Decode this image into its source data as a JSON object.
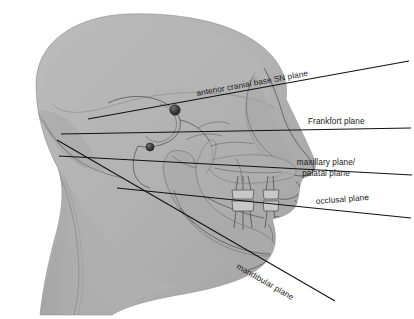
{
  "figure": {
    "background_color": "#ffffff",
    "head_fill_color": "#b0b0b0",
    "skull_fill_color": "#a2a2a2",
    "line_color": "#111111",
    "text_color": "#1a1a1a",
    "width": 414,
    "height": 319
  },
  "planes": [
    {
      "id": "sn-plane",
      "label": "anterior cranial base SN plane",
      "rotated": true,
      "rotation_deg": -12.5,
      "label_x": 197,
      "label_y": 96,
      "line": {
        "x1": 88,
        "y1": 119,
        "x2": 409,
        "y2": 61
      }
    },
    {
      "id": "frankfort-plane",
      "label": "Frankfort plane",
      "rotated": false,
      "rotation_deg": 0,
      "label_x": 308,
      "label_y": 124,
      "line": {
        "x1": 61,
        "y1": 134,
        "x2": 411,
        "y2": 128
      }
    },
    {
      "id": "maxillary-palatal-plane",
      "label_line_1": "maxillary plane/",
      "label_line_2": "palatal plane",
      "rotated": false,
      "rotation_deg": 0,
      "label_x": 326,
      "label_y": 168,
      "line": {
        "x1": 59,
        "y1": 156,
        "x2": 412,
        "y2": 175
      }
    },
    {
      "id": "occlusal-plane",
      "label": "occlusal plane",
      "rotated": true,
      "rotation_deg": -5,
      "label_x": 316,
      "label_y": 204,
      "line": {
        "x1": 117,
        "y1": 188,
        "x2": 411,
        "y2": 218
      }
    },
    {
      "id": "mandibular-plane",
      "label": "mandibular plane",
      "rotated": true,
      "rotation_deg": 30,
      "label_x": 236,
      "label_y": 268,
      "line": {
        "x1": 57,
        "y1": 140,
        "x2": 335,
        "y2": 301
      }
    }
  ],
  "landmarks": [
    {
      "id": "sella-point",
      "name": "sella-landmark",
      "cx": 175,
      "cy": 110,
      "r": 5.2
    },
    {
      "id": "porion-point",
      "name": "porion-landmark",
      "cx": 150,
      "cy": 147,
      "r": 4.0
    }
  ],
  "anatomy": [
    {
      "id": "head-silhouette",
      "name": "head-soft-tissue-profile"
    },
    {
      "id": "cranium",
      "name": "cranial-vault"
    },
    {
      "id": "maxilla",
      "name": "maxilla"
    },
    {
      "id": "mandible",
      "name": "mandible"
    },
    {
      "id": "upper-teeth",
      "name": "upper-dentition"
    },
    {
      "id": "lower-teeth",
      "name": "lower-dentition"
    },
    {
      "id": "neck",
      "name": "neck"
    },
    {
      "id": "nose",
      "name": "nasal-profile"
    },
    {
      "id": "lips",
      "name": "lip-profile"
    },
    {
      "id": "chin",
      "name": "chin-profile"
    }
  ]
}
